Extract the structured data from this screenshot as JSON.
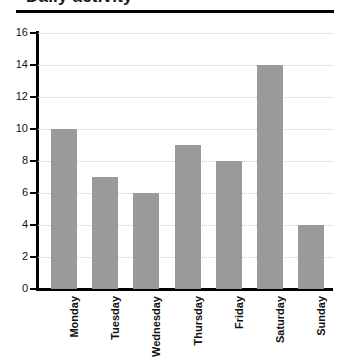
{
  "figure": {
    "title_remnant": "Daily activity",
    "background_color": "#ffffff"
  },
  "chart_data": {
    "type": "bar",
    "title": "",
    "xlabel": "",
    "ylabel": "",
    "categories": [
      "Monday",
      "Tuesday",
      "Wednesday",
      "Thursday",
      "Friday",
      "Saturday",
      "Sunday"
    ],
    "values": [
      10,
      7,
      6,
      9,
      8,
      14,
      4
    ],
    "ylim": [
      0,
      16
    ],
    "ytick_step": 2,
    "yticks": [
      0,
      2,
      4,
      6,
      8,
      10,
      12,
      14,
      16
    ],
    "ytick_labels": [
      "0",
      "2",
      "4",
      "6",
      "8",
      "10",
      "12",
      "14",
      "16"
    ],
    "grid": true,
    "grid_axis": "y",
    "grid_style": "dotted",
    "legend": false,
    "bar_color": "#9a9a9a",
    "axis_color": "#000000",
    "gridline_color": "#c9c9c9",
    "xtick_rotation": 90
  }
}
